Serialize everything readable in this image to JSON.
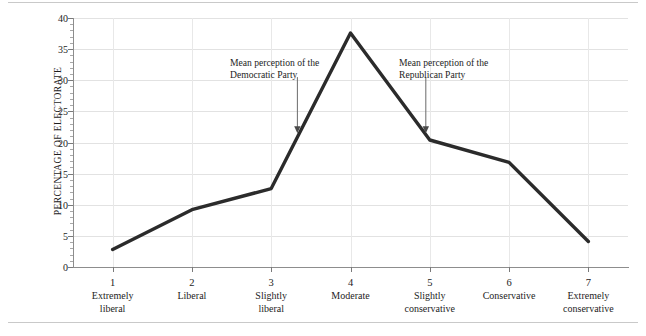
{
  "chart_data": {
    "type": "line",
    "title": "",
    "xlabel": "",
    "ylabel": "PERCENTAGE OF ELECTORATE",
    "categories": [
      "1",
      "2",
      "3",
      "4",
      "5",
      "6",
      "7"
    ],
    "category_labels": [
      "Extremely liberal",
      "Liberal",
      "Slightly liberal",
      "Moderate",
      "Slightly conservative",
      "Conservative",
      "Extremely conservative"
    ],
    "values": [
      2.8,
      9.2,
      12.6,
      37.6,
      20.4,
      16.8,
      4.1
    ],
    "ylim": [
      0,
      40
    ],
    "ytick_values": [
      0,
      5,
      10,
      15,
      20,
      25,
      30,
      35,
      40
    ],
    "ytick_labels": [
      "0",
      "5",
      "10",
      "15",
      "20",
      "25",
      "30",
      "35",
      "40"
    ],
    "grid": true,
    "legend": "none",
    "line_color": "#2b2b2b",
    "grid_color": "#e2e2e2",
    "axis_color": "#8d8d8d",
    "annotations": [
      {
        "id": "democratic",
        "text": "Mean perception of the Democratic Party",
        "x_value": 3.33,
        "arrow_from_y": 30.5,
        "arrow_to_y": 21.5
      },
      {
        "id": "republican",
        "text": "Mean perception of the Republican Party",
        "x_value": 4.95,
        "arrow_from_y": 30.5,
        "arrow_to_y": 21.5
      }
    ]
  },
  "axis": {
    "y": {
      "title": "PERCENTAGE OF ELECTORATE",
      "ticks": [
        {
          "label": "40",
          "value": 40
        },
        {
          "label": "35",
          "value": 35
        },
        {
          "label": "30",
          "value": 30
        },
        {
          "label": "25",
          "value": 25
        },
        {
          "label": "20",
          "value": 20
        },
        {
          "label": "15",
          "value": 15
        },
        {
          "label": "10",
          "value": 10
        },
        {
          "label": "5",
          "value": 5
        },
        {
          "label": "0",
          "value": 0
        }
      ]
    },
    "x": {
      "ticks": [
        {
          "number": "1",
          "line1": "Extremely",
          "line2": "liberal"
        },
        {
          "number": "2",
          "line1": "Liberal",
          "line2": ""
        },
        {
          "number": "3",
          "line1": "Slightly",
          "line2": "liberal"
        },
        {
          "number": "4",
          "line1": "Moderate",
          "line2": ""
        },
        {
          "number": "5",
          "line1": "Slightly",
          "line2": "conservative"
        },
        {
          "number": "6",
          "line1": "Conservative",
          "line2": ""
        },
        {
          "number": "7",
          "line1": "Extremely",
          "line2": "conservative"
        }
      ]
    }
  },
  "annotations": {
    "democratic": "Mean perception of the Democratic Party",
    "republican": "Mean perception of the Republican Party"
  }
}
